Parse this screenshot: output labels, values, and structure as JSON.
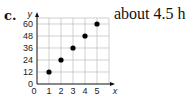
{
  "problem_label": "c.",
  "answer_text": "about 4.5 h",
  "chart_data": {
    "type": "scatter",
    "title": "",
    "xlabel": "x",
    "ylabel": "y",
    "x": [
      1,
      2,
      3,
      4,
      5
    ],
    "y": [
      12,
      24,
      36,
      48,
      60
    ],
    "x_ticks": [
      "0",
      "1",
      "2",
      "3",
      "4",
      "5"
    ],
    "y_ticks": [
      "0",
      "12",
      "24",
      "36",
      "48",
      "60"
    ],
    "xlim": [
      0,
      6
    ],
    "ylim": [
      0,
      66
    ],
    "grid": true,
    "legend": null
  }
}
